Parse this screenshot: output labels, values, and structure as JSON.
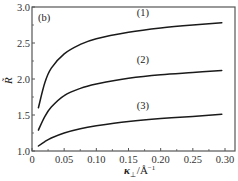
{
  "chart_data": {
    "type": "line",
    "title": "",
    "panel_label": "(b)",
    "xlabel": "κ⊥/Å⁻¹",
    "xlabel_parts": {
      "symbol": "κ",
      "subscript": "⊥",
      "unit": "/Å",
      "unit_sup": "−1"
    },
    "ylabel": "R̃",
    "xlim": [
      0,
      0.31
    ],
    "ylim": [
      1.0,
      3.0
    ],
    "x_ticks": [
      0,
      0.05,
      0.1,
      0.15,
      0.2,
      0.25,
      0.3
    ],
    "x_tick_labels": [
      "0",
      "0.05",
      "0.10",
      "0.15",
      "0.20",
      "0.25",
      "0.30"
    ],
    "y_ticks": [
      1.0,
      1.5,
      2.0,
      2.5,
      3.0
    ],
    "y_tick_labels": [
      "1.0",
      "1.5",
      "2.0",
      "2.5",
      "3.0"
    ],
    "grid": false,
    "legend": "none (inline curve labels)",
    "series": [
      {
        "name": "(1)",
        "label_pos": {
          "x": 0.163,
          "y": 2.87
        },
        "x": [
          0.01,
          0.02,
          0.03,
          0.05,
          0.075,
          0.1,
          0.15,
          0.2,
          0.25,
          0.295
        ],
        "values": [
          1.6,
          1.95,
          2.15,
          2.35,
          2.48,
          2.56,
          2.65,
          2.71,
          2.75,
          2.78
        ]
      },
      {
        "name": "(2)",
        "label_pos": {
          "x": 0.163,
          "y": 2.22
        },
        "x": [
          0.01,
          0.02,
          0.03,
          0.05,
          0.075,
          0.1,
          0.15,
          0.2,
          0.25,
          0.295
        ],
        "values": [
          1.29,
          1.48,
          1.61,
          1.77,
          1.87,
          1.93,
          2.01,
          2.06,
          2.09,
          2.12
        ]
      },
      {
        "name": "(3)",
        "label_pos": {
          "x": 0.163,
          "y": 1.58
        },
        "x": [
          0.01,
          0.02,
          0.03,
          0.05,
          0.075,
          0.1,
          0.15,
          0.2,
          0.25,
          0.295
        ],
        "values": [
          1.07,
          1.13,
          1.18,
          1.25,
          1.31,
          1.35,
          1.41,
          1.45,
          1.48,
          1.51
        ]
      }
    ]
  }
}
